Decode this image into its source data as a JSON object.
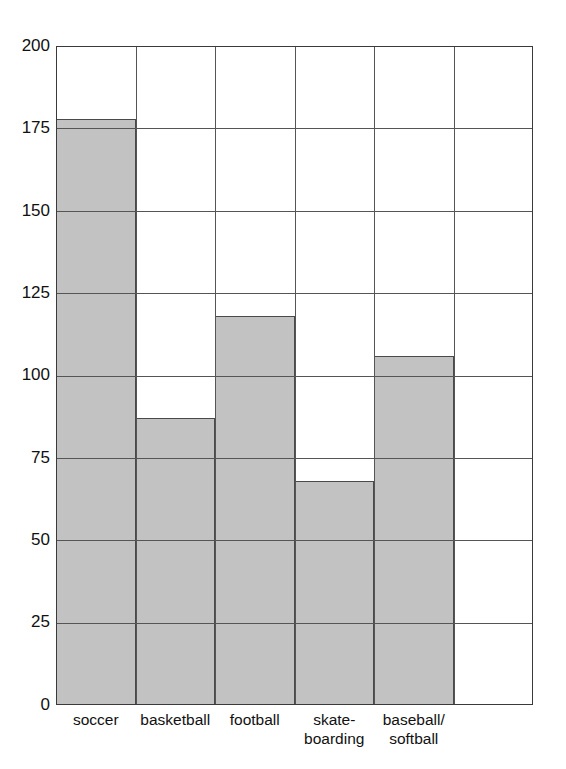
{
  "chart_data": {
    "type": "bar",
    "title": "",
    "subtitle": "",
    "xlabel": "",
    "ylabel": "",
    "categories": [
      "soccer",
      "basketball",
      "football",
      "skate-boarding",
      "baseball/softball"
    ],
    "category_lines": [
      [
        "soccer"
      ],
      [
        "basketball"
      ],
      [
        "football"
      ],
      [
        "skate-",
        "boarding"
      ],
      [
        "baseball/",
        "softball"
      ]
    ],
    "values": [
      178,
      87,
      118,
      68,
      106
    ],
    "ylim": [
      0,
      200
    ],
    "ytick_step": 25,
    "yticks": [
      "0",
      "25",
      "50",
      "75",
      "100",
      "125",
      "150",
      "175",
      "200"
    ],
    "ytick_values": [
      0,
      25,
      50,
      75,
      100,
      125,
      150,
      175,
      200
    ],
    "grid": true,
    "grid_axis": "both",
    "legend": false,
    "legend_position": "none",
    "bar_gap": 0,
    "n_columns": 6,
    "empty_trailing_columns": 1,
    "colors": {
      "bar_fill": "#c2c2c2",
      "bar_outline": "#4a4a4a",
      "gridline": "#555555",
      "frame": "#3a3a3a",
      "background": "#ffffff",
      "text": "#111111"
    }
  }
}
